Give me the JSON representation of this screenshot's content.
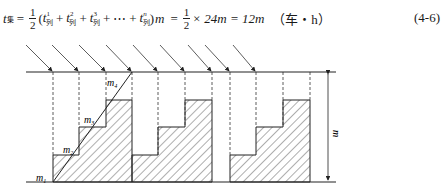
{
  "formula": {
    "lhs_var": "t",
    "lhs_sub": "集",
    "equals": "=",
    "half_num": "1",
    "half_den": "2",
    "open": "(",
    "terms": [
      {
        "var": "t",
        "sup": "1",
        "sub": "列"
      },
      {
        "var": "t",
        "sup": "2",
        "sub": "列"
      },
      {
        "var": "t",
        "sup": "3",
        "sub": "列"
      },
      {
        "var": "t",
        "sup": "n",
        "sub": "列"
      }
    ],
    "plus": "+",
    "ellipsis": "⋯",
    "close": ")",
    "m": "m",
    "rhs": "× 24m = 12m",
    "unit": "（车・h）",
    "equation_number": "(4-6)"
  },
  "figure": {
    "labels": {
      "m1": "m",
      "m1_sub": "1",
      "m2": "m",
      "m2_sub": "2",
      "m3": "m",
      "m3_sub": "3",
      "m4": "m",
      "m4_sub": "4",
      "height_label": "m"
    },
    "stroke_color": "#222222",
    "dash_color": "#333333"
  }
}
